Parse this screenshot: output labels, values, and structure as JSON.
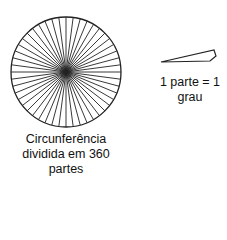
{
  "diagram": {
    "circle": {
      "center": [
        66,
        72
      ],
      "radius": 55,
      "spoke_count": 48,
      "stroke_color": "#222222",
      "caption_lines": [
        "Circunferência",
        "dividida em 360",
        "partes"
      ]
    },
    "wedge": {
      "points": [
        [
          161,
          62
        ],
        [
          214,
          50
        ],
        [
          216,
          56
        ],
        [
          210,
          61
        ]
      ],
      "stroke_color": "#222222",
      "caption_lines": [
        "1 parte = 1",
        "grau"
      ]
    }
  }
}
